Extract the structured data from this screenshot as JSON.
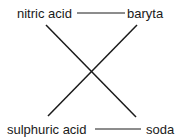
{
  "diagram": {
    "nodes": {
      "top_left": "nitric acid",
      "top_right": "baryta",
      "bottom_left": "sulphuric acid",
      "bottom_right": "soda"
    },
    "edges": [
      {
        "from": "nitric acid",
        "to": "baryta",
        "style": "horizontal"
      },
      {
        "from": "sulphuric acid",
        "to": "soda",
        "style": "horizontal"
      },
      {
        "from": "nitric acid",
        "to": "soda",
        "style": "diagonal"
      },
      {
        "from": "baryta",
        "to": "sulphuric acid",
        "style": "diagonal"
      }
    ],
    "colors": {
      "line": "#1a1a1a",
      "text": "#1a1a1a",
      "background": "#ffffff"
    }
  }
}
